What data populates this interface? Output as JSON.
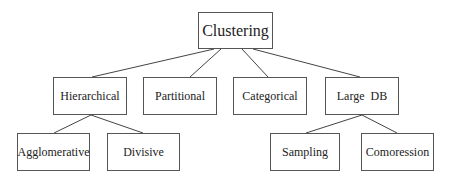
{
  "diagram": {
    "type": "tree",
    "root": {
      "id": "clustering",
      "label": "Clustering",
      "box": [
        198,
        12,
        75,
        37
      ]
    },
    "nodes": [
      {
        "id": "hierarchical",
        "label": "Hierarchical",
        "parent": "clustering",
        "box": [
          53,
          77,
          74,
          38
        ]
      },
      {
        "id": "partitional",
        "label": "Partitional",
        "parent": "clustering",
        "box": [
          143,
          77,
          74,
          38
        ]
      },
      {
        "id": "categorical",
        "label": "Categorical",
        "parent": "clustering",
        "box": [
          233,
          77,
          74,
          38
        ]
      },
      {
        "id": "large-db",
        "label": "Large  DB",
        "parent": "clustering",
        "box": [
          325,
          77,
          74,
          38
        ]
      },
      {
        "id": "agglomerative",
        "label": "Agglomerative",
        "parent": "hierarchical",
        "box": [
          17,
          133,
          73,
          38
        ]
      },
      {
        "id": "divisive",
        "label": "Divisive",
        "parent": "hierarchical",
        "box": [
          107,
          133,
          73,
          38
        ]
      },
      {
        "id": "sampling",
        "label": "Sampling",
        "parent": "large-db",
        "box": [
          270,
          133,
          70,
          38
        ]
      },
      {
        "id": "comoression",
        "label": "Comoression",
        "parent": "large-db",
        "box": [
          361,
          133,
          73,
          38
        ]
      }
    ],
    "edges": [
      {
        "from": "clustering",
        "to": "hierarchical",
        "line": [
          214,
          49,
          92,
          77
        ]
      },
      {
        "from": "clustering",
        "to": "partitional",
        "line": [
          221,
          49,
          190,
          77
        ]
      },
      {
        "from": "clustering",
        "to": "categorical",
        "line": [
          242,
          49,
          268,
          77
        ]
      },
      {
        "from": "clustering",
        "to": "large-db",
        "line": [
          253,
          49,
          360,
          77
        ]
      },
      {
        "from": "hierarchical",
        "to": "agglomerative",
        "line": [
          91,
          115,
          54,
          133
        ]
      },
      {
        "from": "hierarchical",
        "to": "divisive",
        "line": [
          91,
          115,
          143,
          133
        ]
      },
      {
        "from": "large-db",
        "to": "sampling",
        "line": [
          362,
          115,
          306,
          133
        ]
      },
      {
        "from": "large-db",
        "to": "comoression",
        "line": [
          362,
          115,
          397,
          133
        ]
      }
    ]
  }
}
